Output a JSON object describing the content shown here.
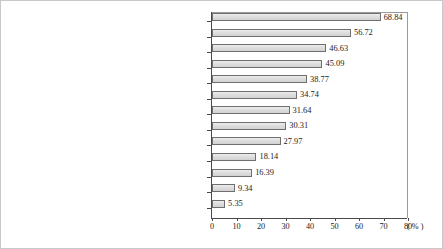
{
  "chart_data": {
    "type": "bar",
    "orientation": "horizontal",
    "title": "",
    "xlabel": "( % )",
    "ylabel": "",
    "xlim": [
      0,
      80
    ],
    "xticks": [
      0,
      10,
      20,
      30,
      40,
      50,
      60,
      70,
      80
    ],
    "grid": false,
    "legend": "none",
    "unit_label": "( % )",
    "categories": [
      "Fostering all-round development of students",
      "Improving quality of teachers, quality of\nteaching, teaching methods, etc.",
      "Treating all students equally",
      "Strengthening effective home-school cooperation",
      "More student-centered student management",
      "Reduce the workload of students",
      "Upgrade classrooms, facilities, accommodation\nconditions, etc.",
      "Reduce class sizes",
      "Put an end to bullying and violence among",
      "Improving students’  test scores",
      "No unreasonable charges",
      "Lower the enrollment requirements",
      "Others"
    ],
    "values": [
      68.84,
      56.72,
      46.63,
      45.09,
      38.77,
      34.74,
      31.64,
      30.31,
      27.97,
      18.14,
      16.39,
      9.34,
      5.35
    ],
    "value_labels": [
      "68.84",
      "56.72",
      "46.63",
      "45.09",
      "38.77",
      "34.74",
      "31.64",
      "30.31",
      "27.97",
      "18.14",
      "16.39",
      "9.34",
      "5.35"
    ],
    "tick_labels": [
      "0",
      "10",
      "20",
      "30",
      "40",
      "50",
      "60",
      "70",
      "80"
    ],
    "colors": {
      "bar_fill": "#dedede",
      "bar_stroke": "#6f6f6f",
      "axis": "#4a4a4a",
      "text": "#2d2d2d",
      "frame": "#c8c8c8"
    }
  }
}
